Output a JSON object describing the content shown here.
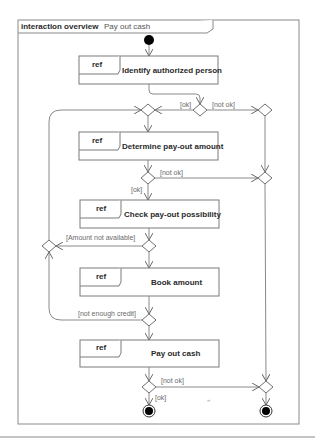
{
  "diagram": {
    "kind_label": "interaction overview",
    "title": "Pay out cash",
    "ref_label": "ref",
    "interactions": [
      {
        "id": "identify",
        "label": "Identify authorized person"
      },
      {
        "id": "determine",
        "label": "Determine pay-out amount"
      },
      {
        "id": "check",
        "label": "Check pay-out possibility"
      },
      {
        "id": "book",
        "label": "Book amount"
      },
      {
        "id": "payout",
        "label": "Pay out cash"
      }
    ],
    "guards": {
      "identify_ok": "[ok]",
      "identify_not_ok": "[not ok]",
      "determine_not_ok": "[not ok]",
      "determine_ok": "[ok]",
      "amount_not_available": "[Amount not available]",
      "not_enough_credit": "[not enough credit]",
      "payout_not_ok": "[not ok]",
      "payout_ok": "[ok]"
    },
    "nodes": {
      "initial": "initial-node",
      "final_ok": "final-node",
      "final_not_ok": "final-node"
    }
  }
}
